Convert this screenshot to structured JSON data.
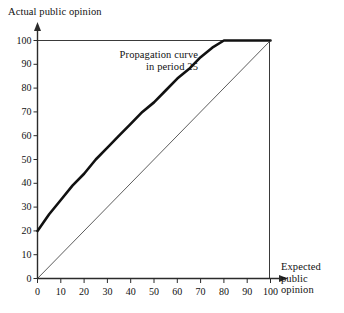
{
  "chart_data": {
    "type": "line",
    "title": "",
    "xlabel": "Expected public opinion",
    "ylabel": "Actual public opinion",
    "xlabel_lines": [
      "Expected",
      "public",
      "opinion"
    ],
    "ylabel_lines": [
      "Actual public opinion"
    ],
    "xlim": [
      0,
      100
    ],
    "ylim": [
      0,
      100
    ],
    "xticks": [
      0,
      10,
      20,
      30,
      40,
      50,
      60,
      70,
      80,
      90,
      100
    ],
    "yticks": [
      0,
      10,
      20,
      30,
      40,
      50,
      60,
      70,
      80,
      90,
      100
    ],
    "grid": false,
    "legend": "none",
    "annotations": [
      {
        "name": "propagation-curve-label",
        "lines": [
          "Propagation curve",
          "in period 25"
        ],
        "x": 30,
        "y": 91
      }
    ],
    "series": [
      {
        "name": "Propagation curve in period 25",
        "style": "bold",
        "color": "#111111",
        "width": 2.6,
        "x": [
          0,
          5,
          10,
          15,
          20,
          25,
          30,
          35,
          40,
          45,
          50,
          55,
          60,
          65,
          70,
          75,
          80,
          85,
          90,
          95,
          100
        ],
        "values": [
          20,
          27,
          33,
          39,
          44,
          50,
          55,
          60,
          65,
          70,
          74,
          79,
          84,
          88,
          93,
          97,
          100,
          100,
          100,
          100,
          100
        ]
      },
      {
        "name": "45-degree reference line",
        "style": "thin",
        "color": "#333333",
        "width": 0.8,
        "x": [
          0,
          100
        ],
        "values": [
          0,
          100
        ]
      }
    ],
    "boundaries": [
      {
        "name": "top-boundary-y100",
        "orientation": "horizontal",
        "value": 100,
        "from": 0,
        "to": 100
      },
      {
        "name": "right-boundary-x100",
        "orientation": "vertical",
        "value": 100,
        "from": 0,
        "to": 100
      }
    ]
  }
}
